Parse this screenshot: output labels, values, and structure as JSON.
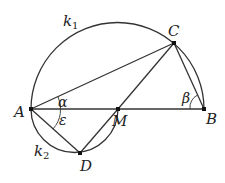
{
  "diagram": {
    "points": {
      "A": {
        "label": "A",
        "x": 31,
        "y": 109
      },
      "B": {
        "label": "B",
        "x": 204,
        "y": 109
      },
      "C": {
        "label": "C",
        "x": 174,
        "y": 43
      },
      "M": {
        "label": "M",
        "x": 118,
        "y": 109
      },
      "D": {
        "label": "D",
        "x": 80,
        "y": 153
      }
    },
    "circles": {
      "k1": {
        "label": "k",
        "sub": "1"
      },
      "k2": {
        "label": "k",
        "sub": "2"
      }
    },
    "angles": {
      "alpha": "α",
      "beta": "β",
      "epsilon": "ε"
    },
    "stroke_color": "#333333"
  }
}
